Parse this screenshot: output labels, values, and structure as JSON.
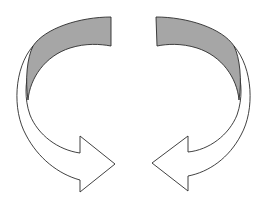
{
  "diagram": {
    "title": "Two curved arrows forming a circular cycle",
    "colors": {
      "background": "#ffffff",
      "band_fill": "#a6a6a6",
      "arrow_fill": "#ffffff",
      "stroke": "#2b2b2b"
    },
    "arrows": [
      {
        "id": "left",
        "direction": "clockwise-down-right",
        "label": ""
      },
      {
        "id": "right",
        "direction": "counterclockwise-down-left",
        "label": ""
      }
    ]
  }
}
